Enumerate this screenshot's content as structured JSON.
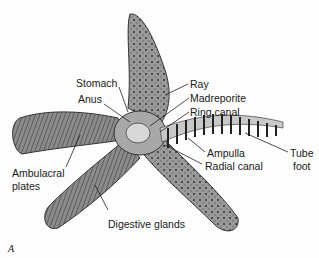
{
  "figure_letter": "A",
  "labels": {
    "stomach": "Stomach",
    "anus": "Anus",
    "ray": "Ray",
    "madreporite": "Madreporite",
    "ring_canal": "Ring canal",
    "ampulla": "Ampulla",
    "radial_canal": "Radial canal",
    "tube_foot_1": "Tube",
    "tube_foot_2": "foot",
    "ambulacral_1": "Ambulacral",
    "ambulacral_2": "plates",
    "digestive_glands": "Digestive glands"
  },
  "colors": {
    "body": "#8a8a8a",
    "body_dark": "#4a4a4a",
    "canal_fill": "#c8c8c8",
    "line": "#222222"
  }
}
